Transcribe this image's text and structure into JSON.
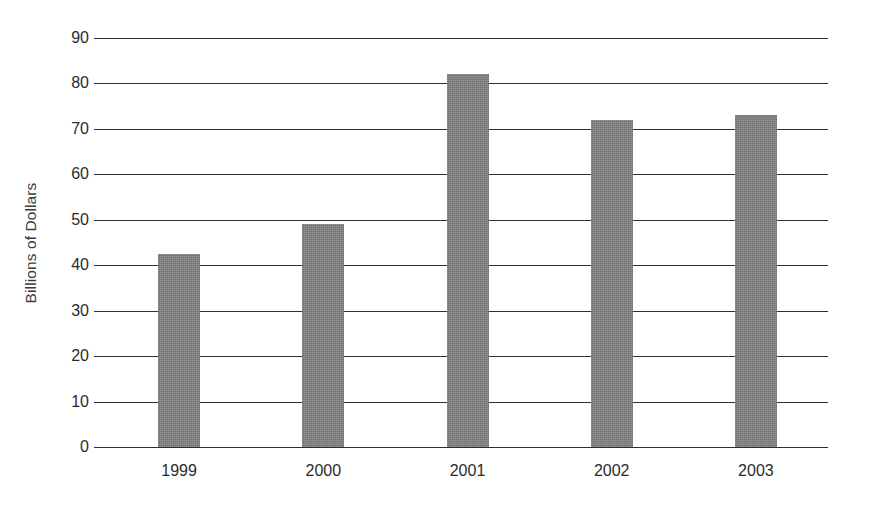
{
  "chart_data": {
    "type": "bar",
    "title": "",
    "subtitle": "",
    "xlabel": "",
    "ylabel": "Billions of Dollars",
    "categories": [
      "1999",
      "2000",
      "2001",
      "2002",
      "2003"
    ],
    "values": [
      42.5,
      49,
      82,
      72,
      73
    ],
    "series": [
      {
        "name": "Billions of Dollars",
        "values": [
          42.5,
          49,
          82,
          72,
          73
        ]
      }
    ],
    "ylim": [
      0,
      90
    ],
    "ytick_labels": [
      "0",
      "10",
      "20",
      "30",
      "40",
      "50",
      "60",
      "70",
      "80",
      "90"
    ],
    "ytick_values": [
      0,
      10,
      20,
      30,
      40,
      50,
      60,
      70,
      80,
      90
    ],
    "grid": true,
    "grid_axis": "y",
    "legend": false,
    "legend_position": "none",
    "bar_color": "#7f7f7f",
    "axis_color": "#2e2e2e",
    "text_color": "#2b2b2b",
    "background_color": "#ffffff",
    "annotations": []
  }
}
